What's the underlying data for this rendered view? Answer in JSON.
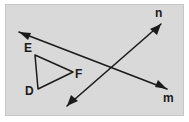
{
  "figure": {
    "background_color": "#d9d9d9",
    "panel_border_color": "#c6c6c6",
    "stroke_color": "#1b1b1b",
    "labels": {
      "E": "E",
      "D": "D",
      "F": "F",
      "n": "n",
      "m": "m"
    },
    "triangle": {
      "name": "triangle-DEF",
      "vertices": {
        "E": [
          35,
          55
        ],
        "D": [
          38,
          89
        ],
        "F": [
          73,
          72
        ]
      }
    },
    "lines": [
      {
        "name": "line-m",
        "label": "m",
        "from": [
          19,
          32
        ],
        "to": [
          167,
          89
        ],
        "arrowheads": "both"
      },
      {
        "name": "line-n",
        "label": "n",
        "from": [
          67,
          106
        ],
        "to": [
          161,
          24
        ],
        "arrowheads": "both"
      }
    ],
    "intersection": [
      105,
      72
    ]
  }
}
